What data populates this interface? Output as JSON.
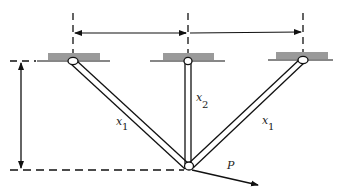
{
  "diagram": {
    "type": "three-bar-truss",
    "colors": {
      "line": "#111111",
      "support": "#9a9a9a",
      "background": "#ffffff"
    },
    "supports": [
      {
        "id": "left",
        "x": 73,
        "y": 61
      },
      {
        "id": "center",
        "x": 188,
        "y": 61
      },
      {
        "id": "right",
        "x": 303,
        "y": 60
      }
    ],
    "load_node": {
      "x": 189,
      "y": 167
    },
    "members": [
      {
        "id": "left-bar",
        "label": "x",
        "subscript": "1"
      },
      {
        "id": "center-bar",
        "label": "x",
        "subscript": "2"
      },
      {
        "id": "right-bar",
        "label": "x",
        "subscript": "1"
      }
    ],
    "load": {
      "label": "P"
    },
    "dimensions": {
      "horizontal_left": {
        "from": "center",
        "to": "left"
      },
      "horizontal_right": {
        "from": "center",
        "to": "right"
      },
      "vertical": {
        "from": "supports",
        "to": "load_node"
      }
    }
  }
}
